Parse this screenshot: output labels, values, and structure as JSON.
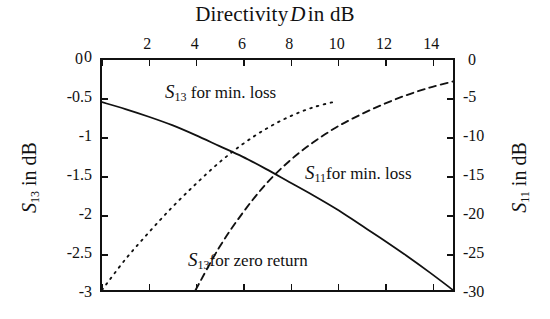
{
  "chart_data": {
    "type": "line",
    "xlabel": "Directivity D in dB",
    "ylabel": "S13 in dB",
    "ylabel_right": "S11 in dB",
    "xlim": [
      0,
      15
    ],
    "ylim": [
      -3,
      0
    ],
    "ylim_right": [
      -30,
      0
    ],
    "grid": false,
    "legend": "inline-annotations",
    "xticks": [
      0,
      2,
      4,
      6,
      8,
      10,
      12,
      14
    ],
    "yticks_left": [
      0,
      -0.5,
      -1,
      -1.5,
      -2,
      -2.5,
      -3
    ],
    "yticks_right": [
      0,
      -5,
      -10,
      -15,
      -20,
      -25,
      -30
    ],
    "series": [
      {
        "name": "S11 for min. loss",
        "style": "solid",
        "axis": "right",
        "x": [
          0,
          1,
          2,
          3,
          4,
          5,
          6,
          7,
          8,
          9,
          10,
          11,
          12,
          13,
          14,
          15
        ],
        "values": [
          -5.5,
          -6.4,
          -7.4,
          -8.5,
          -9.8,
          -11.2,
          -12.6,
          -14.2,
          -15.9,
          -17.6,
          -19.4,
          -21.4,
          -23.4,
          -25.5,
          -27.7,
          -30.0
        ]
      },
      {
        "name": "S13 for min. loss",
        "style": "dotted",
        "axis": "left",
        "x": [
          0,
          1,
          2,
          3,
          4,
          5,
          6,
          7,
          8,
          9,
          10
        ],
        "values": [
          -3.0,
          -2.6,
          -2.25,
          -1.92,
          -1.62,
          -1.34,
          -1.1,
          -0.9,
          -0.74,
          -0.62,
          -0.54
        ]
      },
      {
        "name": "S13 for zero return",
        "style": "dashed",
        "axis": "left",
        "x": [
          4,
          5,
          6,
          7,
          8,
          9,
          10,
          11,
          12,
          13,
          14,
          15
        ],
        "values": [
          -3.0,
          -2.45,
          -2.0,
          -1.62,
          -1.32,
          -1.08,
          -0.88,
          -0.72,
          -0.58,
          -0.46,
          -0.36,
          -0.28
        ]
      }
    ],
    "annotations": [
      {
        "name": "S13 for min. loss",
        "x": 3.2,
        "y": -0.32
      },
      {
        "name": "S11 for min. loss",
        "x": 9.1,
        "y": -1.38
      },
      {
        "name": "S13 for zero return",
        "x": 4.2,
        "y": -2.52
      }
    ]
  },
  "title": {
    "prefix": "Directivity",
    "variable": "D",
    "suffix": "in dB"
  },
  "axes": {
    "x": {
      "ticks": [
        "0",
        "2",
        "4",
        "6",
        "8",
        "10",
        "12",
        "14"
      ],
      "corner_zero": "0"
    },
    "y_left": {
      "ticks": [
        "0",
        "-0.5",
        "-1",
        "-1.5",
        "-2",
        "-2.5",
        "-3"
      ],
      "title_series": "S",
      "title_sub": "13",
      "title_rest": "in dB"
    },
    "y_right": {
      "ticks": [
        "0",
        "-5",
        "-10",
        "-15",
        "-20",
        "-25",
        "-30"
      ],
      "title_series": "S",
      "title_sub": "11",
      "title_rest": "in dB"
    }
  },
  "curve_labels": {
    "s13_min_loss": {
      "series": "S",
      "sub": "13",
      "text": "for min. loss"
    },
    "s11_min_loss": {
      "series": "S",
      "sub": "11",
      "text": "for min. loss"
    },
    "s13_zero_return": {
      "series": "S",
      "sub": "13",
      "text": "for zero return"
    }
  },
  "colors": {
    "axis": "#111111",
    "curve": "#111111",
    "background": "#ffffff"
  }
}
